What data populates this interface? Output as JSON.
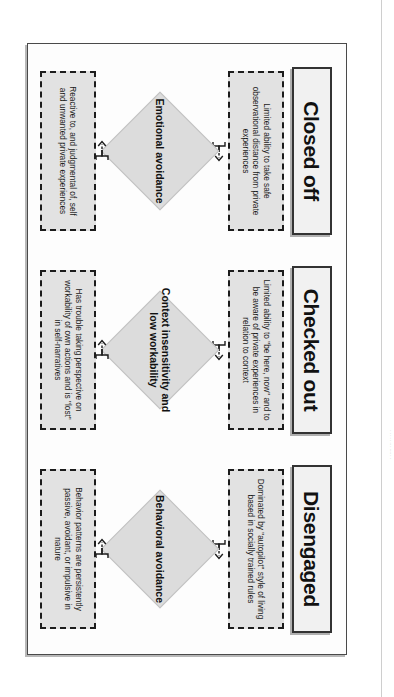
{
  "figure": {
    "orientation": "rotated-90-clockwise",
    "colors": {
      "header_fill": "#f1f1f1",
      "header_border": "#333333",
      "note_fill": "#e2e2e2",
      "note_border": "#1c1c1c",
      "diamond_fill": "#dcdcdc",
      "frame_border": "#4a4a4a",
      "text": "#111111"
    },
    "columns": [
      {
        "header": "Closed off",
        "top_note": "Limited ability to take safe observational distance from private experiences",
        "center": "Emotional avoidance",
        "bottom_note": "Reactive to, and judgmental of, self and unwanted private experiences"
      },
      {
        "header": "Checked out",
        "top_note": "Limited ability to \"be here, now\" and to be aware of private experiences in relation to context",
        "center": "Context insensitivity and low workability",
        "bottom_note": "Has trouble taking perspective on workability of own actions and is \"lost\" in self-narratives"
      },
      {
        "header": "Disengaged",
        "top_note": "Dominated by \"autopilot\" style of living based in socially trained rules",
        "center": "Behavioral avoidance",
        "bottom_note": "Behavior patterns are persistently passive, avoidant, or impulsive in nature"
      }
    ]
  },
  "page_edge": {
    "gutter_text": "· ·  · · ·   ·· ·  ···· · ·"
  }
}
